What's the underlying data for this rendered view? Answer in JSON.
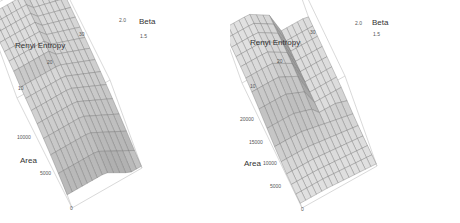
{
  "chart_data": [
    {
      "type": "surface3d",
      "panel": "left",
      "title": "",
      "axes": {
        "z": {
          "label": "Renyi Entropy",
          "ticks": [
            "10",
            "20",
            "30"
          ],
          "range": [
            5,
            35
          ]
        },
        "y": {
          "label": "Beta",
          "ticks": [
            "1.5",
            "2.0"
          ],
          "range": [
            1.0,
            2.0
          ]
        },
        "x": {
          "label": "Area",
          "ticks": [
            "0",
            "5000",
            "10000"
          ],
          "range": [
            0,
            14000
          ]
        }
      },
      "surface": {
        "description": "Entropy high plateau across most of the area/beta range, dropping sharply near low area with a ridge near the center",
        "grid_rows": 14,
        "grid_cols": 14,
        "style": "wireframe-shaded"
      }
    },
    {
      "type": "surface3d",
      "panel": "right",
      "title": "",
      "axes": {
        "z": {
          "label": "Renyi Entropy",
          "ticks": [
            "10",
            "20",
            "30"
          ],
          "range": [
            5,
            35
          ]
        },
        "y": {
          "label": "Beta",
          "ticks": [
            "1.5",
            "2.0"
          ],
          "range": [
            1.0,
            2.0
          ]
        },
        "x": {
          "label": "Area",
          "ticks": [
            "0",
            "5000",
            "10000",
            "15000",
            "20000"
          ],
          "range": [
            0,
            22000
          ]
        }
      },
      "surface": {
        "description": "Entropy plateau at high area then steep drop to a valley at low area, flattening out toward high beta",
        "grid_rows": 14,
        "grid_cols": 14,
        "style": "wireframe-shaded"
      }
    }
  ]
}
